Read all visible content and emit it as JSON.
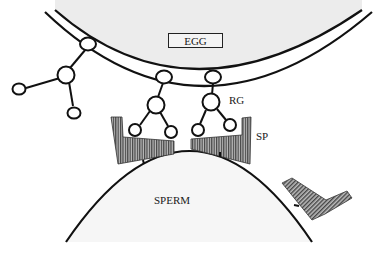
{
  "diagram": {
    "type": "biological-schematic",
    "labels": {
      "egg": "EGG",
      "receptor_glycan": "RG",
      "sperm_protein": "SP",
      "sperm": "SPERM"
    },
    "colors": {
      "stroke": "#111111",
      "egg_fill": "#ececec",
      "sperm_fill": "#f6f6f6",
      "hatch": "#555555",
      "background": "#ffffff"
    },
    "nodes": {
      "glycan_left": [
        "anchor",
        "core",
        "branch-1",
        "branch-2"
      ],
      "glycan_middle": [
        "anchor",
        "core",
        "branch-1",
        "branch-2"
      ],
      "glycan_right": [
        "anchor",
        "core",
        "branch-1",
        "branch-2"
      ]
    },
    "sperm_proteins": [
      "sp-left-bound",
      "sp-right-bound",
      "sp-unbound"
    ]
  }
}
